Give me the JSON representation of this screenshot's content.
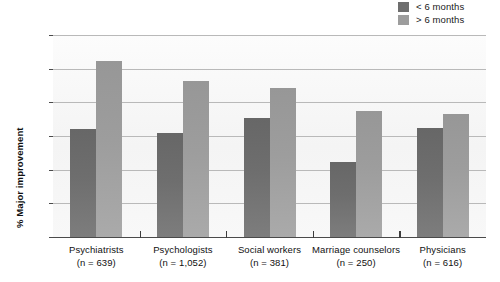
{
  "chart_data": {
    "type": "bar",
    "title": "",
    "subtitle": "",
    "xlabel": "",
    "ylabel": "% Major improvement",
    "ylim": [
      0,
      60
    ],
    "yticks": [
      0,
      10,
      20,
      30,
      40,
      50,
      60
    ],
    "grid": true,
    "legend_position": "top-right",
    "categories": [
      "Psychiatrists",
      "Psychologists",
      "Social workers",
      "Marriage counselors",
      "Physicians"
    ],
    "category_sublabels": [
      "(n = 639)",
      "(n = 1,052)",
      "(n = 381)",
      "(n = 250)",
      "(n = 616)"
    ],
    "category_n": [
      639,
      1052,
      381,
      250,
      616
    ],
    "series": [
      {
        "name": "< 6 months",
        "color": "#6e6e6e",
        "values": [
          32.2,
          31.0,
          35.4,
          22.2,
          32.5
        ]
      },
      {
        "name": "> 6 months",
        "color": "#9d9d9d",
        "values": [
          52.2,
          46.2,
          44.3,
          37.5,
          36.4
        ]
      }
    ]
  },
  "legend": {
    "items": [
      {
        "label": "< 6 months",
        "color": "#6e6e6e"
      },
      {
        "label": "> 6 months",
        "color": "#9d9d9d"
      }
    ]
  },
  "axis": {
    "y_title": "% Major improvement",
    "y_ticks": [
      "60",
      "50",
      "40",
      "30",
      "20",
      "10",
      "0"
    ]
  },
  "categories": [
    {
      "name": "Psychiatrists",
      "sub": "(n = 639)"
    },
    {
      "name": "Psychologists",
      "sub": "(n = 1,052)"
    },
    {
      "name": "Social workers",
      "sub": "(n = 381)"
    },
    {
      "name": "Marriage counselors",
      "sub": "(n = 250)"
    },
    {
      "name": "Physicians",
      "sub": "(n = 616)"
    }
  ]
}
